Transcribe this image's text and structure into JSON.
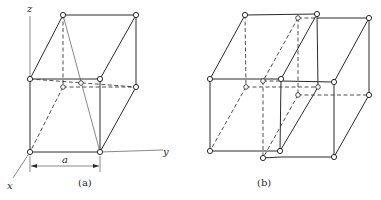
{
  "figure": {
    "panels": [
      {
        "id": "a",
        "caption": "(a)",
        "description": "Unit cell of two stacked cubes with face-centred atom and body diagonal",
        "axes": {
          "x_label": "x",
          "y_label": "y",
          "z_label": "z"
        },
        "dimension_label": "a"
      },
      {
        "id": "b",
        "caption": "(b)",
        "description": "Two interpenetrating cubic cells offset from each other"
      }
    ],
    "colors": {
      "line": "#2a2a2a",
      "background": "#ffffff",
      "atom_fill": "#ffffff"
    }
  }
}
